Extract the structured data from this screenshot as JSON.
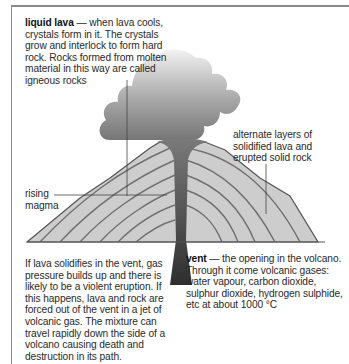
{
  "diagram": {
    "labels": {
      "liquid_lava_term": "liquid lava",
      "liquid_lava_text": " — when lava cools, crystals form in it. The crystals grow and interlock to form hard rock. Rocks formed from molten material in this way are called igneous rocks",
      "layers_text": "alternate layers of solidified lava and erupted solid rock",
      "magma_text": "rising magma",
      "solidify_text": "If lava solidifies in  the vent, gas pressure builds up and there is likely to be a violent eruption. If this happens, lava and rock are forced out of the vent in a jet of volcanic gas. The mixture can travel rapidly down the side of a volcano causing death and destruction in its path.",
      "vent_term": "vent",
      "vent_text": " — the opening in the volcano. Through it come volcanic gases: water vapour, carbon dioxide, sulphur dioxide, hydrogen sulphide, etc at about 1000 °C"
    },
    "colors": {
      "cone_fill": "#cdcdcd",
      "strata_line": "#6e6e6e",
      "vent_dark": "#3a3a3a",
      "cloud_top": "#ededed",
      "cloud_bottom": "#7d7d7d",
      "frame": "#8a8a8a"
    }
  }
}
